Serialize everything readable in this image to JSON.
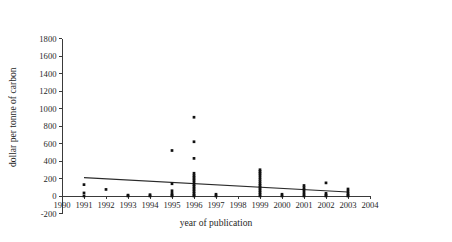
{
  "chart_data": {
    "type": "scatter",
    "title": "",
    "xlabel": "year of publication",
    "ylabel": "dollar per tonne of carbon",
    "xlim": [
      1990,
      2004
    ],
    "ylim": [
      -200,
      1800
    ],
    "xticks": [
      1990,
      1991,
      1992,
      1993,
      1994,
      1995,
      1996,
      1997,
      1998,
      1999,
      2000,
      2001,
      2002,
      2003,
      2004
    ],
    "xtick_labels": [
      "1990",
      "1991",
      "1992",
      "1993",
      "1994",
      "1995",
      "1996",
      "1997",
      "1998",
      "1999",
      "2000",
      "2001",
      "2002",
      "2003",
      "2004"
    ],
    "yticks": [
      -200,
      0,
      200,
      400,
      600,
      800,
      1000,
      1200,
      1400,
      1600,
      1800
    ],
    "ytick_labels": [
      "-200",
      "0",
      "200",
      "400",
      "600",
      "800",
      "1000",
      "1200",
      "1400",
      "1600",
      "1800"
    ],
    "grid": false,
    "legend": false,
    "point_color": "#111111",
    "line_color": "#2a2a2a",
    "axis_color": "#3a3a3a",
    "points": [
      {
        "x": 1991,
        "y": 130
      },
      {
        "x": 1991,
        "y": 35
      },
      {
        "x": 1991,
        "y": 0
      },
      {
        "x": 1992,
        "y": 75
      },
      {
        "x": 1993,
        "y": 10
      },
      {
        "x": 1993,
        "y": 0
      },
      {
        "x": 1994,
        "y": 15
      },
      {
        "x": 1994,
        "y": 0
      },
      {
        "x": 1995,
        "y": 520
      },
      {
        "x": 1995,
        "y": 140
      },
      {
        "x": 1995,
        "y": 60
      },
      {
        "x": 1995,
        "y": 30
      },
      {
        "x": 1995,
        "y": 10
      },
      {
        "x": 1995,
        "y": 0
      },
      {
        "x": 1996,
        "y": 900
      },
      {
        "x": 1996,
        "y": 620
      },
      {
        "x": 1996,
        "y": 430
      },
      {
        "x": 1996,
        "y": 260
      },
      {
        "x": 1996,
        "y": 235
      },
      {
        "x": 1996,
        "y": 215
      },
      {
        "x": 1996,
        "y": 195
      },
      {
        "x": 1996,
        "y": 175
      },
      {
        "x": 1996,
        "y": 150
      },
      {
        "x": 1996,
        "y": 130
      },
      {
        "x": 1996,
        "y": 110
      },
      {
        "x": 1996,
        "y": 90
      },
      {
        "x": 1996,
        "y": 70
      },
      {
        "x": 1996,
        "y": 50
      },
      {
        "x": 1996,
        "y": 30
      },
      {
        "x": 1996,
        "y": 10
      },
      {
        "x": 1996,
        "y": 0
      },
      {
        "x": 1997,
        "y": 20
      },
      {
        "x": 1997,
        "y": 0
      },
      {
        "x": 1999,
        "y": 300
      },
      {
        "x": 1999,
        "y": 280
      },
      {
        "x": 1999,
        "y": 260
      },
      {
        "x": 1999,
        "y": 240
      },
      {
        "x": 1999,
        "y": 215
      },
      {
        "x": 1999,
        "y": 190
      },
      {
        "x": 1999,
        "y": 165
      },
      {
        "x": 1999,
        "y": 140
      },
      {
        "x": 1999,
        "y": 120
      },
      {
        "x": 1999,
        "y": 100
      },
      {
        "x": 1999,
        "y": 80
      },
      {
        "x": 1999,
        "y": 60
      },
      {
        "x": 1999,
        "y": 40
      },
      {
        "x": 1999,
        "y": 20
      },
      {
        "x": 1999,
        "y": 0
      },
      {
        "x": 2000,
        "y": 20
      },
      {
        "x": 2000,
        "y": 0
      },
      {
        "x": 2001,
        "y": 120
      },
      {
        "x": 2001,
        "y": 95
      },
      {
        "x": 2001,
        "y": 70
      },
      {
        "x": 2001,
        "y": 45
      },
      {
        "x": 2001,
        "y": 20
      },
      {
        "x": 2001,
        "y": 0
      },
      {
        "x": 2002,
        "y": 150
      },
      {
        "x": 2002,
        "y": 30
      },
      {
        "x": 2002,
        "y": 10
      },
      {
        "x": 2002,
        "y": 0
      },
      {
        "x": 2003,
        "y": 80
      },
      {
        "x": 2003,
        "y": 55
      },
      {
        "x": 2003,
        "y": 30
      },
      {
        "x": 2003,
        "y": 10
      },
      {
        "x": 2003,
        "y": 0
      }
    ],
    "trend_line": {
      "x_start": 1991,
      "y_start": 210,
      "x_end": 2003,
      "y_end": 45
    }
  }
}
